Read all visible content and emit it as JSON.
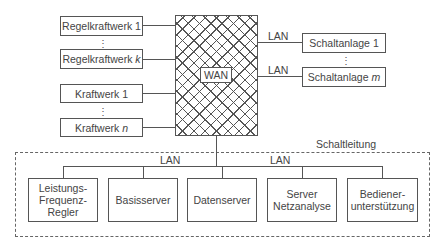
{
  "left_nodes": [
    {
      "label": "Regelkraftwerk 1"
    },
    {
      "label": "Regelkraftwerk",
      "index": "k"
    },
    {
      "label": "Kraftwerk 1"
    },
    {
      "label": "Kraftwerk",
      "index": "n"
    }
  ],
  "wan": {
    "label": "WAN"
  },
  "right_nodes": [
    {
      "label": "Schaltanlage 1",
      "link": "LAN"
    },
    {
      "label": "Schaltanlage",
      "index": "m",
      "link": "LAN"
    }
  ],
  "control_center": {
    "title": "Schaltleitung",
    "lan_labels": [
      "LAN",
      "LAN"
    ],
    "nodes": [
      {
        "label": "Leistungs-\nFrequenz-\nRegler"
      },
      {
        "label": "Basisserver"
      },
      {
        "label": "Datenserver"
      },
      {
        "label": "Server\nNetzanalyse"
      },
      {
        "label": "Bediener-\nunterstützung"
      }
    ]
  },
  "ellipsis": "⋮"
}
